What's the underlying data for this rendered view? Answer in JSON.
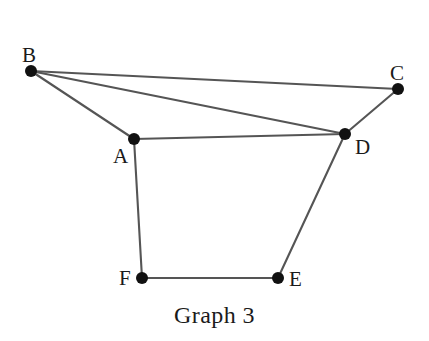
{
  "figure": {
    "caption": "Graph 3",
    "background_color": "#ffffff",
    "edge_color": "#555555",
    "vertex_color": "#111111",
    "label_color": "#1a1a1a",
    "width": 429,
    "height": 341
  },
  "chart_data": {
    "type": "diagram",
    "diagram_kind": "undirected-graph",
    "title": "Graph 3",
    "xlabel": "",
    "ylabel": "",
    "grid": false,
    "legend": "none",
    "vertex_count": 6,
    "edge_count": 8,
    "nodes": [
      {
        "id": "A",
        "label": "A",
        "x": 134,
        "y": 139,
        "label_x": 113,
        "label_y": 146,
        "degree": 3
      },
      {
        "id": "B",
        "label": "B",
        "x": 31,
        "y": 71,
        "label_x": 22,
        "label_y": 45,
        "degree": 3
      },
      {
        "id": "C",
        "label": "C",
        "x": 398,
        "y": 89,
        "label_x": 390,
        "label_y": 63,
        "degree": 2
      },
      {
        "id": "D",
        "label": "D",
        "x": 345,
        "y": 134,
        "label_x": 355,
        "label_y": 137,
        "degree": 4
      },
      {
        "id": "E",
        "label": "E",
        "x": 278,
        "y": 278,
        "label_x": 289,
        "label_y": 269,
        "degree": 2
      },
      {
        "id": "F",
        "label": "F",
        "x": 142,
        "y": 278,
        "label_x": 119,
        "label_y": 268,
        "degree": 2
      }
    ],
    "edges": [
      {
        "source": "B",
        "target": "C"
      },
      {
        "source": "B",
        "target": "D"
      },
      {
        "source": "B",
        "target": "A"
      },
      {
        "source": "A",
        "target": "D"
      },
      {
        "source": "C",
        "target": "D"
      },
      {
        "source": "D",
        "target": "E"
      },
      {
        "source": "A",
        "target": "F"
      },
      {
        "source": "F",
        "target": "E"
      }
    ],
    "vertex_radius": 6
  }
}
